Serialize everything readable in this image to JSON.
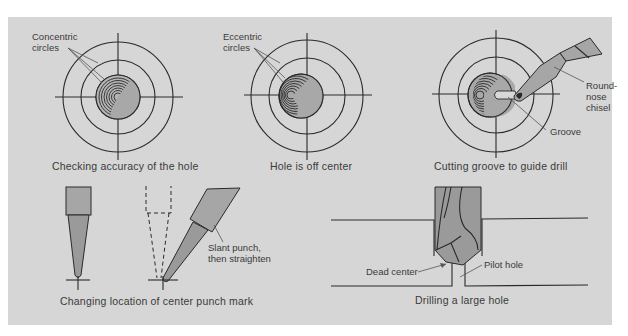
{
  "figure": {
    "background": "#d6d6d6",
    "line_color": "#2a2a2a",
    "tool_fill": "#9a9a9a",
    "panels": [
      {
        "id": "checking-accuracy",
        "caption": "Checking accuracy of the hole",
        "labels": {
          "callout_line1": "Concentric",
          "callout_line2": "circles"
        }
      },
      {
        "id": "hole-off-center",
        "caption": "Hole is off center",
        "labels": {
          "callout_line1": "Eccentric",
          "callout_line2": "circles"
        }
      },
      {
        "id": "cutting-groove",
        "caption": "Cutting groove to guide drill",
        "labels": {
          "chisel_line1": "Round-",
          "chisel_line2": "nose",
          "chisel_line3": "chisel",
          "groove": "Groove"
        }
      },
      {
        "id": "changing-punch-mark",
        "caption": "Changing location of center punch mark",
        "labels": {
          "slant_line1": "Slant punch,",
          "slant_line2": "then straighten"
        }
      },
      {
        "id": "drilling-large-hole",
        "caption": "Drilling a large hole",
        "labels": {
          "dead_center": "Dead center",
          "pilot_hole": "Pilot hole"
        }
      }
    ]
  }
}
